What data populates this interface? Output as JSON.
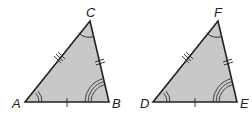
{
  "diagram": {
    "fill_color": "#c8c8c8",
    "stroke_color": "#222222",
    "triangles": [
      {
        "name": "ABC",
        "vertices": {
          "A": {
            "label": "A",
            "x": 25,
            "y": 102
          },
          "B": {
            "label": "B",
            "x": 109,
            "y": 102
          },
          "C": {
            "label": "C",
            "x": 90,
            "y": 21
          }
        },
        "side_marks": {
          "AB": 1,
          "BC": 2,
          "CA": 3
        },
        "angle_marks": {
          "A": 2,
          "B": 3,
          "C": 1
        }
      },
      {
        "name": "DEF",
        "vertices": {
          "D": {
            "label": "D",
            "x": 153,
            "y": 102
          },
          "E": {
            "label": "E",
            "x": 237,
            "y": 102
          },
          "F": {
            "label": "F",
            "x": 218,
            "y": 21
          }
        },
        "side_marks": {
          "DE": 1,
          "EF": 2,
          "FD": 3
        },
        "angle_marks": {
          "D": 2,
          "E": 3,
          "F": 1
        }
      }
    ]
  }
}
